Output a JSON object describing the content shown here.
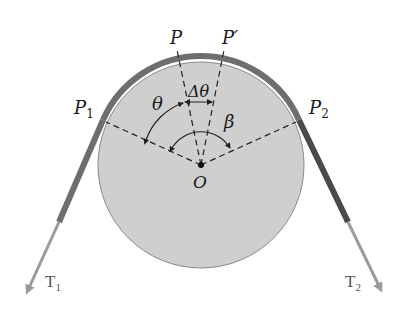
{
  "diagram": {
    "labels": {
      "P": "P",
      "P_prime": "P′",
      "P1": "P",
      "P1_sub": "1",
      "P2": "P",
      "P2_sub": "2",
      "theta": "θ",
      "delta_theta": "Δθ",
      "beta": "β",
      "O": "O",
      "T1": "T",
      "T1_sub": "1",
      "T2": "T",
      "T2_sub": "2"
    },
    "colors": {
      "drum_fill": "#cfcfcf",
      "drum_stroke": "#8a8a8a",
      "belt": "#6e6e6e",
      "belt_right": "#4a4a4a",
      "arrow": "#9a9a9a",
      "dashed": "#222222"
    }
  }
}
